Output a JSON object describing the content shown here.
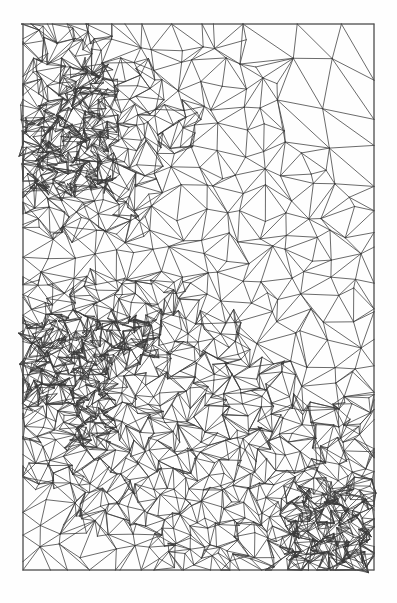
{
  "figure": {
    "background_color": "#fefefe",
    "line_color": "#3a3a3a",
    "border_color": "#5a5a5a",
    "line_width": 0.75
  },
  "chart_data": {
    "type": "diagram",
    "subtype": "triangular-mesh",
    "xlabel": "",
    "ylabel": "",
    "grid": false,
    "legend": null,
    "domain": {
      "x_min": 23,
      "y_min": 24,
      "x_max": 374,
      "y_max": 570,
      "width": 351,
      "height": 546
    },
    "base_grid": {
      "columns": 8,
      "rows": 13,
      "cell_width": 43.875,
      "cell_height": 42.0
    },
    "refinement": {
      "max_level": 3,
      "scheme": "quadtree-subdivision-with-diagonal-triangulation",
      "note": "Each base quad is split into 2 triangles; refined quads split into 4 sub-quads recursively, each sub-quad split into triangles"
    },
    "refinement_levels": [
      [
        2,
        2,
        1,
        1,
        1,
        0,
        0,
        0
      ],
      [
        2,
        3,
        2,
        1,
        1,
        1,
        0,
        0
      ],
      [
        3,
        3,
        2,
        2,
        1,
        1,
        0,
        0
      ],
      [
        3,
        3,
        2,
        1,
        1,
        1,
        1,
        0
      ],
      [
        2,
        2,
        2,
        1,
        1,
        1,
        1,
        1
      ],
      [
        1,
        1,
        1,
        1,
        1,
        1,
        1,
        1
      ],
      [
        2,
        2,
        2,
        2,
        1,
        1,
        1,
        1
      ],
      [
        3,
        3,
        3,
        2,
        2,
        1,
        1,
        1
      ],
      [
        3,
        3,
        2,
        2,
        2,
        2,
        1,
        1
      ],
      [
        2,
        3,
        2,
        2,
        2,
        2,
        2,
        2
      ],
      [
        2,
        2,
        2,
        2,
        2,
        2,
        2,
        2
      ],
      [
        1,
        2,
        2,
        2,
        2,
        2,
        3,
        3
      ],
      [
        1,
        1,
        1,
        2,
        2,
        2,
        3,
        3
      ]
    ],
    "jitter_amplitude": 0.22,
    "diagonal_pattern": "alternating",
    "total_base_cells": 104
  }
}
